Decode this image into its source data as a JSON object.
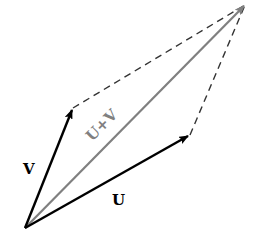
{
  "diagram": {
    "type": "vector-addition-parallelogram",
    "vectors": [
      {
        "id": "U",
        "label": "U",
        "from": [
          25,
          228
        ],
        "to": [
          190,
          135
        ],
        "color": "#000000"
      },
      {
        "id": "V",
        "label": "V",
        "from": [
          25,
          228
        ],
        "to": [
          73,
          108
        ],
        "color": "#000000"
      },
      {
        "id": "UV",
        "label": "U+V",
        "from": [
          25,
          228
        ],
        "to": [
          245,
          5
        ],
        "color": "#808080"
      }
    ],
    "dashed_edges": [
      {
        "from": [
          73,
          108
        ],
        "to": [
          245,
          5
        ]
      },
      {
        "from": [
          190,
          135
        ],
        "to": [
          245,
          5
        ]
      }
    ],
    "labels": {
      "u": "U",
      "v": "V",
      "sum": "U+V"
    },
    "colors": {
      "vector": "#000000",
      "sum_vector": "#808080",
      "dashed": "#333333",
      "background": "#ffffff"
    }
  }
}
